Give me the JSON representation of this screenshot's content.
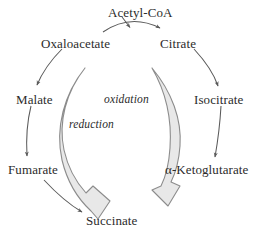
{
  "diagram": {
    "background_color": "#ffffff",
    "text_color": "#2b2b2b",
    "thin_arrow_color": "#5a5a5a",
    "band_stroke_color": "#8c8c8c",
    "band_fill_color": "#e8e8e8",
    "nodes": [
      {
        "id": "acetyl-coa",
        "label": "Acetyl-CoA"
      },
      {
        "id": "oxaloacetate",
        "label": "Oxaloacetate"
      },
      {
        "id": "citrate",
        "label": "Citrate"
      },
      {
        "id": "malate",
        "label": "Malate"
      },
      {
        "id": "isocitrate",
        "label": "Isocitrate"
      },
      {
        "id": "fumarate",
        "label": "Fumarate"
      },
      {
        "id": "alpha-ketoglutarate",
        "label": "α-Ketoglutarate"
      },
      {
        "id": "succinate",
        "label": "Succinate"
      }
    ],
    "process_labels": [
      {
        "id": "reduction",
        "label": "reduction"
      },
      {
        "id": "oxidation",
        "label": "oxidation"
      }
    ]
  }
}
